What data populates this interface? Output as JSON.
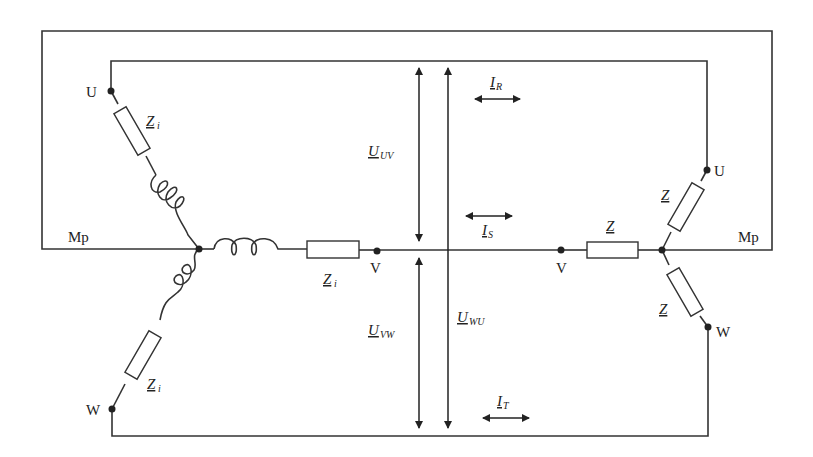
{
  "diagram": {
    "type": "three-phase star-star circuit",
    "labels": {
      "neutral_left": "Mp",
      "neutral_right": "Mp",
      "left_U": "U",
      "left_V": "V",
      "left_W": "W",
      "right_U": "U",
      "right_V": "V",
      "right_W": "W"
    },
    "components": {
      "source_impedance": {
        "main": "Z",
        "sub": "i"
      },
      "load_impedance": {
        "main": "Z",
        "sub": ""
      }
    },
    "voltages": [
      {
        "main": "U",
        "sub": "UV"
      },
      {
        "main": "U",
        "sub": "VW"
      },
      {
        "main": "U",
        "sub": "WU"
      }
    ],
    "currents": [
      {
        "main": "I",
        "sub": "R"
      },
      {
        "main": "I",
        "sub": "S"
      },
      {
        "main": "I",
        "sub": "T"
      }
    ]
  }
}
